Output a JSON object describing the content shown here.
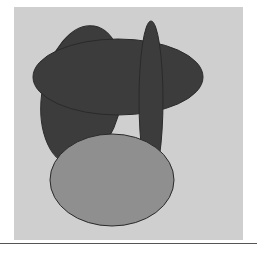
{
  "figure": {
    "panel_color": "#cfcfcf",
    "outline_color": "#2a2a2a",
    "shapes": [
      {
        "name": "dark-ellipse-back",
        "fill": "#3c3c3c"
      },
      {
        "name": "dark-ellipse-wide",
        "fill": "#3c3c3c"
      },
      {
        "name": "dark-ellipse-tall",
        "fill": "#3c3c3c"
      },
      {
        "name": "light-ellipse",
        "fill": "#8f8f8f"
      }
    ]
  },
  "caption": {
    "text": ""
  }
}
